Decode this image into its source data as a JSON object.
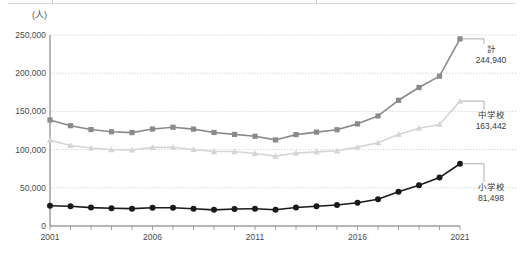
{
  "chart_data": {
    "type": "line",
    "title": "",
    "subtitle": "",
    "unit_label": "(人)",
    "xlabel": "",
    "ylabel": "",
    "grid": true,
    "legend_position": "right-inline-annotations",
    "xlim": [
      2001,
      2021
    ],
    "ylim": [
      0,
      250000
    ],
    "ytick_labels": [
      "0",
      "50,000",
      "100,000",
      "150,000",
      "200,000",
      "250,000"
    ],
    "ytick_values": [
      0,
      50000,
      100000,
      150000,
      200000,
      250000
    ],
    "xtick_labels": [
      "2001",
      "2006",
      "2011",
      "2016",
      "2021"
    ],
    "xtick_values": [
      2001,
      2006,
      2011,
      2016,
      2021
    ],
    "x": [
      2001,
      2002,
      2003,
      2004,
      2005,
      2006,
      2007,
      2008,
      2009,
      2010,
      2011,
      2012,
      2013,
      2014,
      2015,
      2016,
      2017,
      2018,
      2019,
      2020,
      2021
    ],
    "series": [
      {
        "name": "計",
        "end_label": "計",
        "end_value_label": "244,940",
        "color": "#8a8a8a",
        "marker": "square",
        "values": [
          138722,
          131252,
          126226,
          123317,
          122255,
          126894,
          129254,
          126805,
          122432,
          119891,
          117458,
          112689,
          119617,
          122902,
          126009,
          133683,
          144031,
          164528,
          181272,
          196127,
          244940
        ]
      },
      {
        "name": "中学校",
        "end_label": "中学校",
        "end_value_label": "163,442",
        "color": "#d5d5d5",
        "marker": "triangle",
        "values": [
          112211,
          105383,
          102149,
          100007,
          99578,
          102940,
          103069,
          100105,
          97428,
          97428,
          94836,
          91446,
          95442,
          97033,
          98408,
          103235,
          108999,
          119687,
          127922,
          132777,
          163442
        ]
      },
      {
        "name": "小学校",
        "end_label": "小学校",
        "end_value_label": "81,498",
        "color": "#1a1a1a",
        "marker": "circle",
        "values": [
          26511,
          25869,
          24077,
          23310,
          22709,
          23825,
          23927,
          22652,
          21111,
          22327,
          22622,
          21243,
          24175,
          25864,
          27583,
          30448,
          35032,
          44841,
          53350,
          63350,
          81498
        ]
      }
    ]
  },
  "axis": {
    "axis_color": "#7a7a7a",
    "grid_color": "#c9c9c9"
  }
}
